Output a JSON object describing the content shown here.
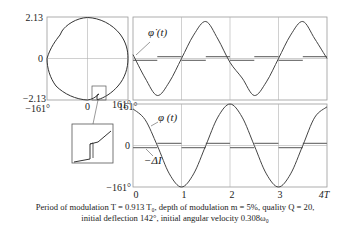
{
  "figure": {
    "phase_portrait": {
      "y_ticks": {
        "top": "2.13",
        "mid": "0",
        "bottom": "−2.13"
      },
      "x_ticks": {
        "left": "−161°",
        "mid": "0",
        "right": "161°"
      }
    },
    "top_plot": {
      "curve_label": "φ̇ (t)"
    },
    "bottom_plot": {
      "y_ticks": {
        "top": "161°",
        "mid": "0",
        "bottom": "−161°"
      },
      "x_ticks": [
        "0",
        "1",
        "2",
        "3",
        "4T"
      ],
      "curve_label": "φ (t)",
      "current_label": "−ΔI"
    },
    "caption": {
      "line1": "Period of modulation T = 0.913 T₀, depth of modulation m = 5%, quality Q = 20,",
      "line2": "initial deflection 142°, initial angular velocity 0.308ω₀"
    }
  },
  "chart_data": [
    {
      "type": "line",
      "title": "Phase portrait",
      "xlabel": "φ",
      "ylabel": "φ̇",
      "xlim": [
        -161,
        161
      ],
      "ylim": [
        -2.13,
        2.13
      ],
      "x_tick_labels": [
        "−161°",
        "0",
        "161°"
      ],
      "y_tick_labels": [
        "−2.13",
        "0",
        "2.13"
      ],
      "grid": true,
      "inset": "magnified view of jump near φ≈60°, φ̇≈−2"
    },
    {
      "type": "line",
      "title": "Angular velocity vs time",
      "x": [
        0,
        0.25,
        0.5,
        0.75,
        1,
        1.25,
        1.5,
        1.75,
        2,
        2.25,
        2.5,
        2.75,
        3,
        3.25,
        3.5,
        3.75,
        4
      ],
      "series": [
        {
          "name": "φ̇(t)",
          "values": [
            0.2,
            -1.0,
            -1.9,
            -1.2,
            0.0,
            1.2,
            1.9,
            1.0,
            -0.2,
            -1.0,
            -1.9,
            -1.2,
            0.0,
            1.2,
            1.9,
            1.0,
            0.0
          ]
        },
        {
          "name": "−ΔI",
          "values": [
            -0.05,
            -0.05,
            0.05,
            0.05,
            -0.05,
            -0.05,
            0.05,
            0.05,
            -0.05,
            -0.05,
            0.05,
            0.05,
            -0.05,
            -0.05,
            0.05,
            0.05,
            0.05
          ]
        }
      ],
      "xlim": [
        0,
        4
      ],
      "ylim": [
        -2.13,
        2.13
      ],
      "grid": true
    },
    {
      "type": "line",
      "title": "Deflection vs time",
      "x": [
        0,
        0.25,
        0.5,
        0.75,
        1,
        1.25,
        1.5,
        1.75,
        2,
        2.25,
        2.5,
        2.75,
        3,
        3.25,
        3.5,
        3.75,
        4
      ],
      "series": [
        {
          "name": "φ(t)",
          "values": [
            142,
            100,
            0,
            -110,
            -161,
            -110,
            0,
            110,
            161,
            110,
            0,
            -110,
            -161,
            -110,
            0,
            110,
            150
          ]
        },
        {
          "name": "−ΔI",
          "values": [
            -8,
            -8,
            8,
            8,
            -8,
            -8,
            8,
            8,
            -8,
            -8,
            8,
            8,
            -8,
            -8,
            8,
            8,
            8
          ]
        }
      ],
      "xlim": [
        0,
        4
      ],
      "ylim": [
        -161,
        161
      ],
      "x_tick_labels": [
        "0",
        "1",
        "2",
        "3",
        "4T"
      ],
      "y_tick_labels": [
        "−161°",
        "0",
        "161°"
      ],
      "grid": true
    }
  ]
}
